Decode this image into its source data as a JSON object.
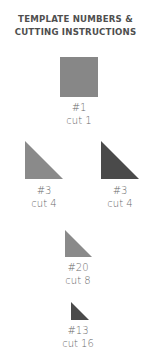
{
  "title": {
    "line1": "TEMPLATE NUMBERS &",
    "line2": "CUTTING INSTRUCTIONS"
  },
  "templates": [
    {
      "shape": "square",
      "color": "#878787",
      "number": "#1",
      "cut": "cut 1"
    },
    {
      "shape": "right-triangle",
      "color": "#8a8a8a",
      "number": "#3",
      "cut": "cut 4"
    },
    {
      "shape": "right-triangle",
      "color": "#4a4a4a",
      "number": "#3",
      "cut": "cut 4"
    },
    {
      "shape": "right-triangle",
      "color": "#8a8a8a",
      "number": "#20",
      "cut": "cut 8"
    },
    {
      "shape": "right-triangle",
      "color": "#4a4a4a",
      "number": "#13",
      "cut": "cut 16"
    }
  ]
}
